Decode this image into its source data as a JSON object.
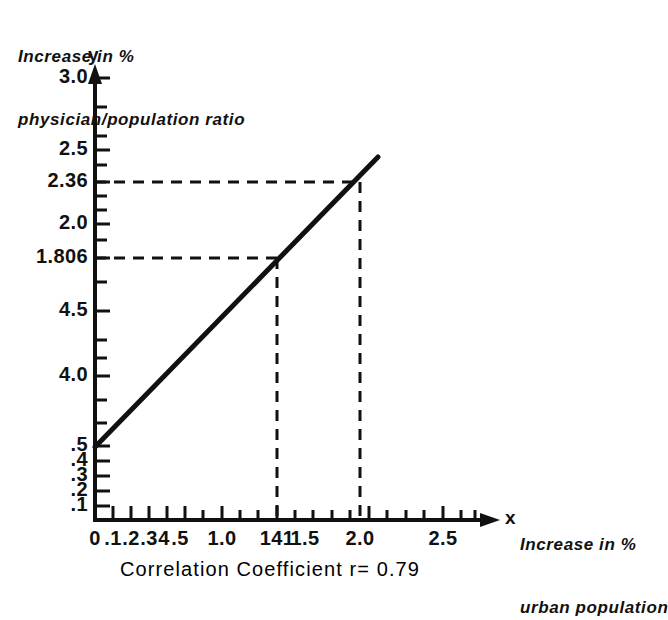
{
  "figure": {
    "caption": "Correlation Coefficient  r= 0.79",
    "y_axis_title_line1": "Increase in %",
    "y_axis_title_line2": "physician/population ratio",
    "x_axis_title_line1": "Increase in %",
    "x_axis_title_line2": "urban population",
    "y_variable": "y",
    "x_variable": "x"
  },
  "chart_data": {
    "type": "line",
    "title": "Correlation Coefficient  r= 0.79",
    "xlabel": "Increase in % urban population",
    "ylabel": "Increase in % physician/population ratio",
    "xlim": [
      0,
      2.7
    ],
    "ylim": [
      0,
      3.1
    ],
    "grid": false,
    "legend": "none",
    "correlation_coefficient": 0.79,
    "series": [
      {
        "name": "regression line",
        "style": "solid",
        "x": [
          0,
          2.15
        ],
        "y": [
          0.5,
          2.53
        ]
      }
    ],
    "x_tick_labels": [
      "0",
      ".1",
      ".2",
      ".3",
      "4",
      ".5",
      "1.0",
      "1.41",
      "1.5",
      "2.0",
      "2.5"
    ],
    "x_tick_values": [
      0,
      0.1,
      0.2,
      0.3,
      0.4,
      0.5,
      1.0,
      1.41,
      1.5,
      2.0,
      2.5
    ],
    "y_tick_labels": [
      ".1",
      ".2",
      ".3",
      ".4",
      ".5",
      "4.0",
      "4.5",
      "1.806",
      "2.0",
      "2.36",
      "2.5",
      "3.0"
    ],
    "y_tick_values": [
      0.1,
      0.2,
      0.3,
      0.4,
      0.5,
      1.0,
      1.5,
      1.806,
      2.0,
      2.36,
      2.5,
      3.0
    ],
    "annotations": [
      {
        "label": "projection",
        "x": 1.41,
        "y": 1.806,
        "style": "dashed"
      },
      {
        "label": "projection",
        "x": 2.0,
        "y": 2.36,
        "style": "dashed"
      }
    ]
  },
  "y_ticks": [
    {
      "label": "3.0",
      "y": 78
    },
    {
      "label": "2.5",
      "y": 150
    },
    {
      "label": "2.36",
      "y": 182
    },
    {
      "label": "2.0",
      "y": 224
    },
    {
      "label": "1.806",
      "y": 258
    },
    {
      "label": "4.5",
      "y": 311
    },
    {
      "label": "4.0",
      "y": 376
    },
    {
      "label": ".5",
      "y": 446
    },
    {
      "label": ".4",
      "y": 461
    },
    {
      "label": ".3",
      "y": 476
    },
    {
      "label": ".2",
      "y": 491
    },
    {
      "label": ".1",
      "y": 506
    }
  ],
  "x_ticks": [
    {
      "label": "0",
      "x": 95
    },
    {
      "label": ".1",
      "x": 113
    },
    {
      "label": ".2",
      "x": 131
    },
    {
      "label": ".3",
      "x": 149
    },
    {
      "label": "4",
      "x": 164
    },
    {
      "label": ".5",
      "x": 180
    },
    {
      "label": "1.0",
      "x": 222
    },
    {
      "label": "141",
      "x": 277
    },
    {
      "label": "1.5",
      "x": 305
    },
    {
      "label": "2.0",
      "x": 360
    },
    {
      "label": "2.5",
      "x": 443
    }
  ]
}
